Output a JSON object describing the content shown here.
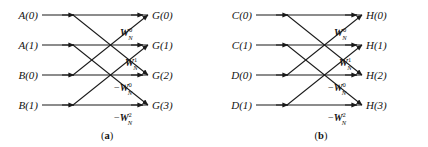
{
  "figure": {
    "background_color": "#ffffff",
    "line_color": "#1a1a1a",
    "text_color": "#121212",
    "width": 428,
    "height": 147
  },
  "geometry": {
    "row_y": [
      15,
      45,
      75,
      105
    ],
    "line_start_x": 42,
    "line_end_x": 148,
    "arrow_x": [
      73,
      142
    ],
    "crossings": [
      {
        "from_row": 0,
        "to_row": 2
      },
      {
        "from_row": 1,
        "to_row": 3
      },
      {
        "from_row": 2,
        "to_row": 0
      },
      {
        "from_row": 3,
        "to_row": 1
      }
    ]
  },
  "diagrams": [
    {
      "id": "a",
      "caption_open": "(",
      "caption_letter": "a",
      "caption_close": ")",
      "inputs": [
        {
          "name": "A",
          "index": "(0)",
          "full": "A(0)"
        },
        {
          "name": "A",
          "index": "(1)",
          "full": "A(1)"
        },
        {
          "name": "B",
          "index": "(0)",
          "full": "B(0)"
        },
        {
          "name": "B",
          "index": "(1)",
          "full": "B(1)"
        }
      ],
      "outputs": [
        {
          "name": "G",
          "index": "(0)",
          "full": "G(0)"
        },
        {
          "name": "G",
          "index": "(1)",
          "full": "G(1)"
        },
        {
          "name": "G",
          "index": "(2)",
          "full": "G(2)"
        },
        {
          "name": "G",
          "index": "(3)",
          "full": "G(3)"
        }
      ],
      "twiddles": [
        {
          "sign": "",
          "symbol": "W",
          "subscript": "N",
          "superscript": "0",
          "full": "W_N^0"
        },
        {
          "sign": "",
          "symbol": "W",
          "subscript": "N",
          "superscript": "1",
          "full": "W_N^1"
        },
        {
          "sign": "−",
          "symbol": "W",
          "subscript": "N",
          "superscript": "0",
          "full": "-W_N^0"
        },
        {
          "sign": "−",
          "symbol": "W",
          "subscript": "N",
          "superscript": "2",
          "full": "-W_N^2"
        }
      ]
    },
    {
      "id": "b",
      "caption_open": "(",
      "caption_letter": "b",
      "caption_close": ")",
      "inputs": [
        {
          "name": "C",
          "index": "(0)",
          "full": "C(0)"
        },
        {
          "name": "C",
          "index": "(1)",
          "full": "C(1)"
        },
        {
          "name": "D",
          "index": "(0)",
          "full": "D(0)"
        },
        {
          "name": "D",
          "index": "(1)",
          "full": "D(1)"
        }
      ],
      "outputs": [
        {
          "name": "H",
          "index": "(0)",
          "full": "H(0)"
        },
        {
          "name": "H",
          "index": "(1)",
          "full": "H(1)"
        },
        {
          "name": "H",
          "index": "(2)",
          "full": "H(2)"
        },
        {
          "name": "H",
          "index": "(3)",
          "full": "H(3)"
        }
      ],
      "twiddles": [
        {
          "sign": "",
          "symbol": "W",
          "subscript": "N",
          "superscript": "0",
          "full": "W_N^0"
        },
        {
          "sign": "",
          "symbol": "W",
          "subscript": "N",
          "superscript": "1",
          "full": "W_N^1"
        },
        {
          "sign": "−",
          "symbol": "W",
          "subscript": "N",
          "superscript": "0",
          "full": "-W_N^0"
        },
        {
          "sign": "−",
          "symbol": "W",
          "subscript": "N",
          "superscript": "2",
          "full": "-W_N^2"
        }
      ]
    }
  ]
}
